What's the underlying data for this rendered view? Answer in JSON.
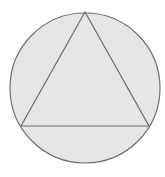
{
  "diagram": {
    "colors": {
      "fill": "#e6e6e6",
      "stroke": "#6e6e6e",
      "background": "#ffffff"
    },
    "circle": {
      "cx": 85,
      "cy": 88,
      "r": 75
    },
    "triangle": {
      "points": "85,12 21,126 149,126"
    }
  }
}
